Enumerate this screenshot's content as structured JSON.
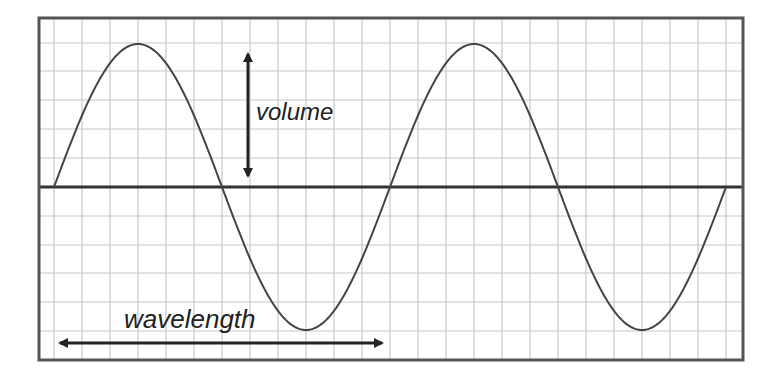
{
  "diagram": {
    "labels": {
      "volume": "volume",
      "wavelength": "wavelength"
    },
    "colors": {
      "background": "#ffffff",
      "grid": "#c8c8c8",
      "frame": "#555555",
      "axis": "#333333",
      "wave": "#444444",
      "arrow": "#222222"
    },
    "frame": {
      "x": 39,
      "y": 18,
      "width": 704,
      "height": 342
    },
    "grid": {
      "x_start": 54,
      "x_step": 28,
      "x_count": 25,
      "y_lines": [
        43,
        71,
        100,
        129,
        158,
        216,
        245,
        273,
        302,
        331
      ]
    },
    "axis_y": 187,
    "wave": {
      "x_start": 54,
      "x_end": 726,
      "period_px": 336,
      "amplitude_px": 143,
      "cycles": 2
    },
    "volume_arrow": {
      "x": 248,
      "y_top": 46,
      "y_bottom": 184
    },
    "wavelength_arrow": {
      "y": 343,
      "x_left": 52,
      "x_right": 390
    }
  }
}
